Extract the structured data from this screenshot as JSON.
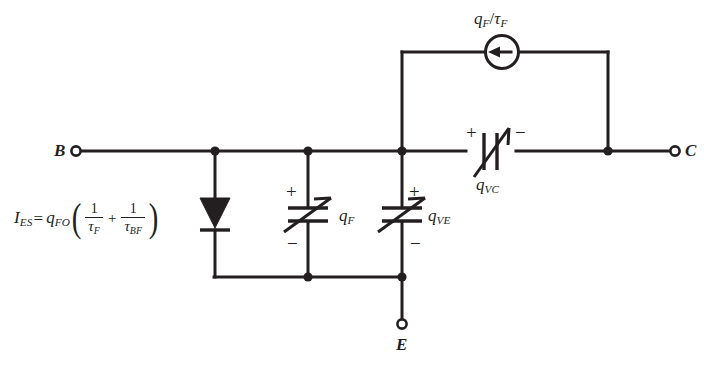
{
  "figure": {
    "type": "circuit-schematic",
    "background_color": "#ffffff",
    "line_color": "#231f20"
  },
  "terminals": [
    {
      "id": "base",
      "label": "B",
      "x": 75,
      "y": 151
    },
    {
      "id": "collector",
      "label": "C",
      "x": 676,
      "y": 151
    },
    {
      "id": "emitter",
      "label": "E",
      "x": 402,
      "y": 325
    }
  ],
  "components": {
    "diode": {
      "name": "emitter-diode",
      "label_equation": "I_ES = q_FO(1/tau_F + 1/tau_BF)",
      "equation_parts": {
        "lhs_symbol": "I",
        "lhs_sub": "ES",
        "equals": "=",
        "coefficient_symbol": "q",
        "coefficient_sub": "FO",
        "open_paren": "(",
        "term1_num": "1",
        "term1_den_symbol": "τ",
        "term1_den_sub": "F",
        "operator": "+",
        "term2_num": "1",
        "term2_den_symbol": "τ",
        "term2_den_sub": "BF",
        "close_paren": ")"
      },
      "orientation": "vertical-down"
    },
    "cap_qf": {
      "name": "variable-capacitor-qf",
      "symbol": "q",
      "subscript": "F",
      "plus": "+",
      "minus": "−",
      "orientation": "vertical"
    },
    "cap_qve": {
      "name": "variable-capacitor-qve",
      "symbol": "q",
      "subscript": "VE",
      "plus": "+",
      "minus": "−",
      "orientation": "vertical"
    },
    "cap_qvc": {
      "name": "variable-capacitor-qvc",
      "symbol": "q",
      "subscript": "VC",
      "plus": "+",
      "minus": "−",
      "orientation": "horizontal"
    },
    "current_source": {
      "name": "current-source-qf-over-tauf",
      "numerator_symbol": "q",
      "numerator_sub": "F",
      "slash": "/",
      "denominator_symbol": "τ",
      "denominator_sub": "F",
      "arrow_direction": "left"
    }
  }
}
